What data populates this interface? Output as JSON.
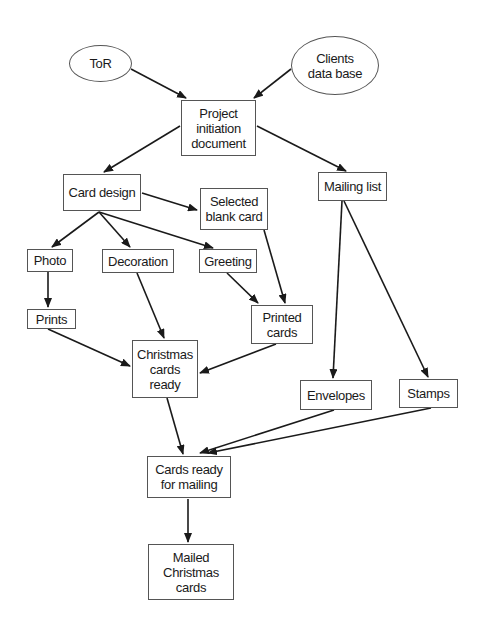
{
  "diagram": {
    "type": "flowchart",
    "colors": {
      "line": "#1a1a1a",
      "border": "#555555",
      "background": "#ffffff"
    },
    "nodes": [
      {
        "id": "tor",
        "label": "ToR",
        "shape": "ellipse",
        "x": 69,
        "y": 45,
        "w": 63,
        "h": 37
      },
      {
        "id": "clients",
        "label": "Clients\ndata base",
        "shape": "ellipse",
        "x": 291,
        "y": 36,
        "w": 88,
        "h": 59
      },
      {
        "id": "pid",
        "label": "Project\ninitiation\ndocument",
        "shape": "box",
        "x": 181,
        "y": 100,
        "w": 75,
        "h": 56
      },
      {
        "id": "card_design",
        "label": "Card design",
        "shape": "box",
        "x": 63,
        "y": 174,
        "w": 78,
        "h": 37
      },
      {
        "id": "selected",
        "label": "Selected\nblank card",
        "shape": "box",
        "x": 200,
        "y": 188,
        "w": 68,
        "h": 42
      },
      {
        "id": "mailing",
        "label": "Mailing list",
        "shape": "box",
        "x": 318,
        "y": 172,
        "w": 69,
        "h": 29
      },
      {
        "id": "photo",
        "label": "Photo",
        "shape": "box",
        "x": 27,
        "y": 249,
        "w": 46,
        "h": 23
      },
      {
        "id": "decoration",
        "label": "Decoration",
        "shape": "box",
        "x": 102,
        "y": 249,
        "w": 72,
        "h": 24
      },
      {
        "id": "greeting",
        "label": "Greeting",
        "shape": "box",
        "x": 199,
        "y": 249,
        "w": 58,
        "h": 24
      },
      {
        "id": "prints",
        "label": "Prints",
        "shape": "box",
        "x": 27,
        "y": 309,
        "w": 49,
        "h": 20
      },
      {
        "id": "printed",
        "label": "Printed\ncards",
        "shape": "box",
        "x": 251,
        "y": 305,
        "w": 62,
        "h": 39
      },
      {
        "id": "xmas_ready",
        "label": "Christmas\ncards\nready",
        "shape": "box",
        "x": 132,
        "y": 340,
        "w": 66,
        "h": 58
      },
      {
        "id": "envelopes",
        "label": "Envelopes",
        "shape": "box",
        "x": 300,
        "y": 380,
        "w": 72,
        "h": 30
      },
      {
        "id": "stamps",
        "label": "Stamps",
        "shape": "box",
        "x": 399,
        "y": 379,
        "w": 59,
        "h": 29
      },
      {
        "id": "ready_mail",
        "label": "Cards ready\nfor mailing",
        "shape": "box",
        "x": 147,
        "y": 456,
        "w": 84,
        "h": 42
      },
      {
        "id": "mailed",
        "label": "Mailed\nChristmas\ncards",
        "shape": "box",
        "x": 148,
        "y": 544,
        "w": 86,
        "h": 56
      }
    ],
    "edges": [
      {
        "from": "tor",
        "to": "pid",
        "x1": 131,
        "y1": 69,
        "x2": 186,
        "y2": 98
      },
      {
        "from": "clients",
        "to": "pid",
        "x1": 291,
        "y1": 69,
        "x2": 254,
        "y2": 98
      },
      {
        "from": "pid",
        "to": "card_design",
        "x1": 180,
        "y1": 126,
        "x2": 104,
        "y2": 172
      },
      {
        "from": "pid",
        "to": "mailing",
        "x1": 257,
        "y1": 126,
        "x2": 346,
        "y2": 171
      },
      {
        "from": "card_design",
        "to": "selected",
        "x1": 142,
        "y1": 193,
        "x2": 197,
        "y2": 210
      },
      {
        "from": "card_design",
        "to": "photo",
        "x1": 99,
        "y1": 212,
        "x2": 52,
        "y2": 247
      },
      {
        "from": "card_design",
        "to": "decoration",
        "x1": 99,
        "y1": 212,
        "x2": 130,
        "y2": 247
      },
      {
        "from": "card_design",
        "to": "greeting",
        "x1": 99,
        "y1": 212,
        "x2": 213,
        "y2": 248
      },
      {
        "from": "photo",
        "to": "prints",
        "x1": 48,
        "y1": 272,
        "x2": 48,
        "y2": 307
      },
      {
        "from": "decoration",
        "to": "xmas_ready",
        "x1": 137,
        "y1": 273,
        "x2": 164,
        "y2": 338
      },
      {
        "from": "greeting",
        "to": "printed",
        "x1": 227,
        "y1": 273,
        "x2": 258,
        "y2": 303
      },
      {
        "from": "selected",
        "to": "printed",
        "x1": 264,
        "y1": 230,
        "x2": 285,
        "y2": 303
      },
      {
        "from": "prints",
        "to": "xmas_ready",
        "x1": 48,
        "y1": 329,
        "x2": 130,
        "y2": 366
      },
      {
        "from": "printed",
        "to": "xmas_ready",
        "x1": 276,
        "y1": 344,
        "x2": 200,
        "y2": 373
      },
      {
        "from": "mailing",
        "to": "envelopes",
        "x1": 342,
        "y1": 201,
        "x2": 333,
        "y2": 378
      },
      {
        "from": "mailing",
        "to": "stamps",
        "x1": 344,
        "y1": 201,
        "x2": 428,
        "y2": 377
      },
      {
        "from": "xmas_ready",
        "to": "ready_mail",
        "x1": 167,
        "y1": 398,
        "x2": 183,
        "y2": 454
      },
      {
        "from": "envelopes",
        "to": "ready_mail",
        "x1": 334,
        "y1": 410,
        "x2": 200,
        "y2": 453
      },
      {
        "from": "stamps",
        "to": "ready_mail",
        "x1": 431,
        "y1": 408,
        "x2": 208,
        "y2": 453
      },
      {
        "from": "ready_mail",
        "to": "mailed",
        "x1": 188,
        "y1": 499,
        "x2": 188,
        "y2": 542
      }
    ]
  }
}
